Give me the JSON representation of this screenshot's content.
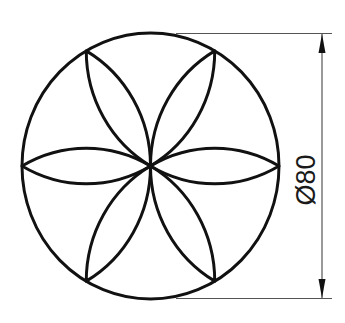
{
  "drawing": {
    "type": "technical-drawing",
    "shape": "circle with six-petal rosette",
    "petal_count": 6,
    "stroke_color": "#111111",
    "dimension_line_color": "#555555",
    "dimension": {
      "label": "Ø80",
      "value": 80,
      "symbol": "Ø",
      "orientation": "vertical"
    }
  }
}
